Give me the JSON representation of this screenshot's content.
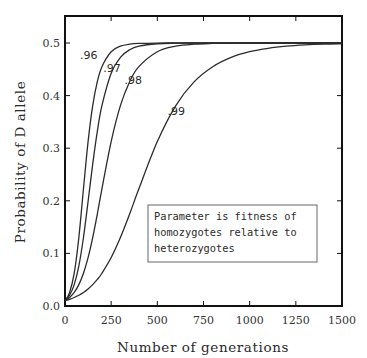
{
  "chart_data": {
    "type": "line",
    "title": "",
    "xlabel": "Number of generations",
    "ylabel": "Probability of D allele",
    "xlim": [
      0,
      1500
    ],
    "ylim": [
      0,
      0.55
    ],
    "x_ticks": [
      0,
      250,
      500,
      750,
      1000,
      1250,
      1500
    ],
    "x_tick_labels": [
      "0",
      "250",
      "500",
      "750",
      "1000",
      "1250",
      "1500"
    ],
    "y_ticks": [
      0.0,
      0.1,
      0.2,
      0.3,
      0.4,
      0.5
    ],
    "y_tick_labels": [
      "0.0",
      "0.1",
      "0.2",
      "0.3",
      "0.4",
      "0.5"
    ],
    "grid": false,
    "legend": {
      "placement": "lower-right",
      "lines": [
        "Parameter is fitness of",
        "homozygotes relative to",
        "heterozygotes"
      ]
    },
    "x": [
      0,
      25,
      50,
      75,
      100,
      125,
      150,
      175,
      200,
      250,
      300,
      350,
      400,
      500,
      600,
      700,
      800,
      900,
      1000,
      1100,
      1200,
      1300,
      1400,
      1500
    ],
    "series": [
      {
        "name": ".96",
        "values": [
          0.01,
          0.0258,
          0.0623,
          0.1302,
          0.2228,
          0.3126,
          0.381,
          0.4265,
          0.455,
          0.4834,
          0.4939,
          0.4978,
          0.4992,
          0.4999,
          0.5,
          0.5,
          0.5,
          0.5,
          0.5,
          0.5,
          0.5,
          0.5,
          0.5,
          0.5
        ],
        "label_at": [
          146,
          0.477
        ]
      },
      {
        "name": ".97",
        "values": [
          0.01,
          0.0205,
          0.0406,
          0.0761,
          0.1302,
          0.1987,
          0.2697,
          0.3321,
          0.381,
          0.4425,
          0.4727,
          0.4871,
          0.4939,
          0.4986,
          0.4997,
          0.5,
          0.5,
          0.5,
          0.5,
          0.5,
          0.5,
          0.5,
          0.5,
          0.5
        ],
        "label_at": [
          272,
          0.452
        ]
      },
      {
        "name": ".98",
        "values": [
          0.01,
          0.0162,
          0.0258,
          0.0406,
          0.0623,
          0.0921,
          0.1302,
          0.1749,
          0.2228,
          0.3126,
          0.381,
          0.4265,
          0.455,
          0.4834,
          0.4939,
          0.4978,
          0.4992,
          0.4999,
          0.5,
          0.5,
          0.5,
          0.5,
          0.5,
          0.5
        ],
        "label_at": [
          387,
          0.43
        ]
      },
      {
        "name": ".99",
        "values": [
          0.01,
          0.0127,
          0.0162,
          0.0205,
          0.0258,
          0.0325,
          0.0406,
          0.0505,
          0.0623,
          0.0921,
          0.1302,
          0.1749,
          0.2228,
          0.3126,
          0.381,
          0.4265,
          0.455,
          0.4727,
          0.4834,
          0.4899,
          0.4939,
          0.4963,
          0.4978,
          0.4986
        ],
        "label_at": [
          620,
          0.37
        ]
      }
    ],
    "line_color": "#2b2b2b",
    "frame_color": "#111111"
  }
}
